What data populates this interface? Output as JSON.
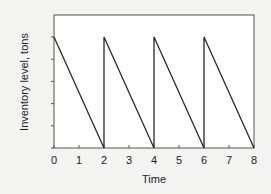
{
  "chart_data": {
    "type": "line",
    "title": "",
    "xlabel": "Time",
    "ylabel": "Inventory level, tons",
    "xlim": [
      0,
      8
    ],
    "ylim": [
      0,
      6
    ],
    "x_ticks": [
      "0",
      "1",
      "2",
      "3",
      "4",
      "5",
      "6",
      "7",
      "8"
    ],
    "y_tick_count": 6,
    "y_tick_labels_shown": false,
    "grid": false,
    "legend": null,
    "series": [
      {
        "name": "Inventory level",
        "points": [
          [
            0,
            5
          ],
          [
            2,
            0
          ],
          [
            2,
            5
          ],
          [
            4,
            0
          ],
          [
            4,
            5
          ],
          [
            6,
            0
          ],
          [
            6,
            5
          ],
          [
            8,
            0
          ]
        ]
      }
    ]
  },
  "colors": {
    "background": "#f4f4f2",
    "plot_area": "#ffffff",
    "line": "#2a2a2a",
    "axis": "#444444"
  }
}
